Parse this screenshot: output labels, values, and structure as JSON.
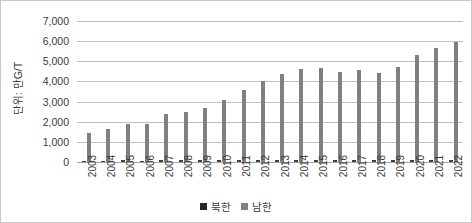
{
  "chart_data": {
    "type": "bar",
    "title": "",
    "subtitle": "",
    "xlabel": "",
    "ylabel": "단위: 만G/T",
    "ylim": [
      0,
      7000
    ],
    "ytick_step": 1000,
    "ytick_labels": [
      "7,000",
      "6,000",
      "5,000",
      "4,000",
      "3,000",
      "2,000",
      "1,000",
      "0"
    ],
    "ytick_values": [
      7000,
      6000,
      5000,
      4000,
      3000,
      2000,
      1000,
      0
    ],
    "grid": true,
    "legend_position": "bottom",
    "categories": [
      "2003",
      "2004",
      "2005",
      "2006",
      "2007",
      "2008",
      "2009",
      "2010",
      "2011",
      "2012",
      "2013",
      "2014",
      "2015",
      "2016",
      "2017",
      "2018",
      "2019",
      "2020",
      "2021",
      "2022"
    ],
    "series": [
      {
        "name": "북한",
        "color": "#404040",
        "values": [
          60,
          70,
          80,
          75,
          80,
          90,
          85,
          85,
          90,
          90,
          95,
          100,
          100,
          95,
          100,
          95,
          95,
          90,
          90,
          85
        ]
      },
      {
        "name": "남한",
        "color": "#808080",
        "values": [
          1420,
          1640,
          1900,
          1870,
          2390,
          2460,
          2680,
          3100,
          3570,
          4030,
          4390,
          4620,
          4650,
          4480,
          4590,
          4410,
          4720,
          5290,
          5650,
          5970
        ]
      }
    ]
  },
  "legend": {
    "items": [
      {
        "label": "북한",
        "swatch": "north"
      },
      {
        "label": "남한",
        "swatch": "south"
      }
    ]
  }
}
